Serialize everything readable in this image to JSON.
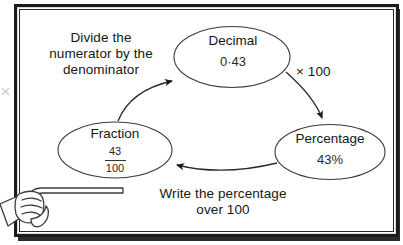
{
  "board": {
    "title": "Fraction, Decimal and Percentage conversion cycle",
    "frame_color": "#1b1b1b",
    "background_color": "#ffffff",
    "ink_color": "#161616"
  },
  "instructions": {
    "divide": "Divide the\nnumerator by the\ndenominator",
    "times": "× 100",
    "write": "Write the percentage\nover 100"
  },
  "nodes": [
    {
      "id": "decimal",
      "title": "Decimal",
      "value": "0·43"
    },
    {
      "id": "percentage",
      "title": "Percentage",
      "value": "43%"
    },
    {
      "id": "fraction",
      "title": "Fraction",
      "numerator": "43",
      "denominator": "100"
    }
  ],
  "arrows": [
    {
      "id": "fraction-to-decimal",
      "from": "Fraction",
      "to": "Decimal",
      "label": "Divide the numerator by the denominator"
    },
    {
      "id": "decimal-to-percentage",
      "from": "Decimal",
      "to": "Percentage",
      "label": "× 100"
    },
    {
      "id": "percentage-to-fraction",
      "from": "Percentage",
      "to": "Fraction",
      "label": "Write the percentage over 100"
    }
  ],
  "pointer": {
    "name": "hand-holding-pointer-stick"
  }
}
